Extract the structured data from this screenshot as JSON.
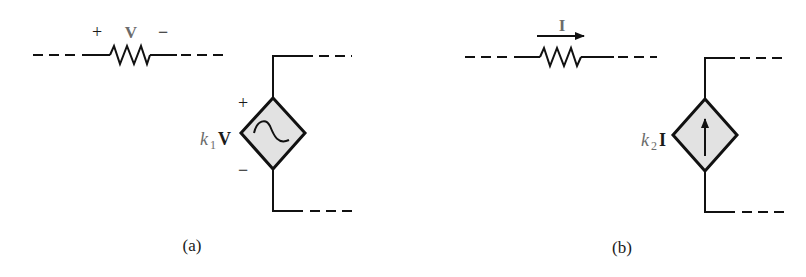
{
  "figure": {
    "panels": [
      {
        "id": "a",
        "caption": "(a)",
        "resistor": {
          "plus": "+",
          "variable": "V",
          "minus": "−"
        },
        "source": {
          "type": "dependent voltage source",
          "symbol": "sine-wave",
          "coefficient": "k",
          "subscript": "1",
          "controlling_variable": "V",
          "plus": "+",
          "minus": "−"
        }
      },
      {
        "id": "b",
        "caption": "(b)",
        "resistor": {
          "variable": "I",
          "direction": "right-arrow"
        },
        "source": {
          "type": "dependent current source",
          "symbol": "up-arrow",
          "coefficient": "k",
          "subscript": "2",
          "controlling_variable": "I"
        }
      }
    ]
  }
}
